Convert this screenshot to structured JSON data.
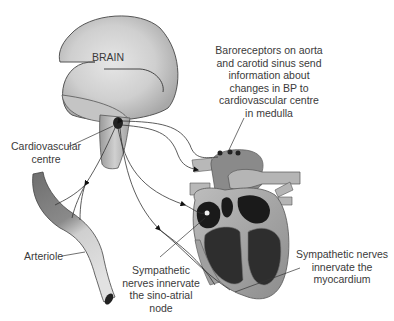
{
  "diagram": {
    "nodes": {
      "brain": {
        "label": "BRAIN"
      },
      "cardiovascular_centre": {
        "label": "Cardiovascular\ncentre"
      },
      "arteriole": {
        "label": "Arteriole"
      },
      "heart": {
        "label": ""
      }
    },
    "annotations": {
      "baroreceptors": "Baroreceptors on aorta\nand carotid sinus send\ninformation about\nchanges in BP to\ncardiovascular centre\nin medulla",
      "sa_node": "Sympathetic\nnerves innervate\nthe sino-atrial\nnode",
      "myocardium": "Sympathetic nerves\ninnervate the\nmyocardium"
    },
    "edges": [
      {
        "from": "baroreceptors",
        "to": "cardiovascular_centre",
        "type": "afferent"
      },
      {
        "from": "cardiovascular_centre",
        "to": "arteriole",
        "type": "sympathetic"
      },
      {
        "from": "cardiovascular_centre",
        "to": "sa_node",
        "type": "sympathetic"
      },
      {
        "from": "cardiovascular_centre",
        "to": "myocardium",
        "type": "sympathetic"
      }
    ],
    "colors": {
      "brain_fill": "#d9d9d9",
      "outline": "#4a4a4a",
      "heart_dark": "#1a1a1a",
      "heart_mid": "#8a8a8a",
      "text": "#3a3a3a"
    }
  }
}
